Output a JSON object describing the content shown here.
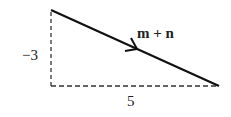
{
  "diagram": {
    "type": "vector-triangle",
    "vector": {
      "label": "m + n",
      "start": [
        51,
        10
      ],
      "end": [
        219,
        86
      ],
      "color": "#111111"
    },
    "vertical_leg": {
      "label": "−3",
      "style": "dashed"
    },
    "horizontal_leg": {
      "label": "5",
      "style": "dashed"
    }
  }
}
